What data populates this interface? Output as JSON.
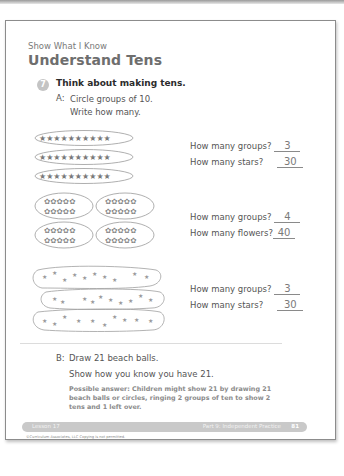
{
  "page": {
    "kicker": "Show What I Know",
    "title": "Understand Tens"
  },
  "question": {
    "number": "7",
    "prompt": "Think about making tens.",
    "part_a": {
      "label": "A:",
      "line1": "Circle groups of 10.",
      "line2": "Write how many.",
      "sets": [
        {
          "item_icon": "solid-star-icon",
          "group_layout": "3 rows of 10 in horizontal ovals",
          "q1": "How many groups?",
          "a1": "3",
          "q2": "How many stars?",
          "a2": "30"
        },
        {
          "item_icon": "outline-flower-icon",
          "group_layout": "4 ovals in 2x2 grid, each 2 rows of 5",
          "q1": "How many groups?",
          "a1": "4",
          "q2": "How many flowers?",
          "a2": "40"
        },
        {
          "item_icon": "scattered-star-icon",
          "group_layout": "3 irregular loops of 10 scattered stars",
          "q1": "How many groups?",
          "a1": "3",
          "q2": "How many stars?",
          "a2": "30"
        }
      ]
    },
    "part_b": {
      "label": "B:",
      "line1": "Draw 21 beach balls.",
      "line2": "Show how you know you have 21.",
      "possible_answer": "Possible answer: Children might show 21 by drawing 21 beach balls or circles, ringing 2 groups of ten to show 2 tens and 1 left over."
    }
  },
  "footer": {
    "lesson": "Lesson 17",
    "part": "Part 9: Independent Practice",
    "page_number": "81",
    "copyright": "©Curriculum Associates, LLC   Copying is not permitted."
  },
  "colors": {
    "title_gray": "#6e6e6e",
    "answer_gray": "#8a8a8a",
    "footer_bar": "#c9c9c9"
  }
}
